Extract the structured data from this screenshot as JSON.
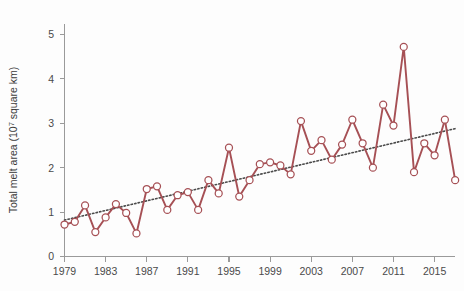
{
  "chart_data": {
    "type": "line",
    "title": "",
    "subtitle": "",
    "xlabel": "",
    "ylabel": "Total melt area (10⁷ square km)",
    "ylabel_parts": {
      "before": "Total melt area (10",
      "sup": "7",
      "after": " square km)"
    },
    "xlim": [
      1978.2,
      2017.6
    ],
    "ylim": [
      0,
      5.45
    ],
    "grid": false,
    "legend": null,
    "x_tick_labels": [
      "1979",
      "1983",
      "1987",
      "1991",
      "1995",
      "1999",
      "2003",
      "2007",
      "2011",
      "2015"
    ],
    "x_tick_values": [
      1979,
      1983,
      1987,
      1991,
      1995,
      1999,
      2003,
      2007,
      2011,
      2015
    ],
    "y_tick_labels": [
      "0",
      "1",
      "2",
      "3",
      "4",
      "5"
    ],
    "y_tick_values": [
      0,
      1,
      2,
      3,
      4,
      5
    ],
    "x": [
      1979,
      1980,
      1981,
      1982,
      1983,
      1984,
      1985,
      1986,
      1987,
      1988,
      1989,
      1990,
      1991,
      1992,
      1993,
      1994,
      1995,
      1996,
      1997,
      1998,
      1999,
      2000,
      2001,
      2002,
      2003,
      2004,
      2005,
      2006,
      2007,
      2008,
      2009,
      2010,
      2011,
      2012,
      2013,
      2014,
      2015,
      2016,
      2017
    ],
    "series": [
      {
        "name": "Total melt area",
        "color": "#a65055",
        "marker": "open-circle",
        "marker_face": "#ffffff",
        "values": [
          0.72,
          0.78,
          1.15,
          0.55,
          0.88,
          1.18,
          0.98,
          0.52,
          1.52,
          1.58,
          1.05,
          1.38,
          1.45,
          1.05,
          1.72,
          1.42,
          2.45,
          1.35,
          1.72,
          2.08,
          2.12,
          2.05,
          1.85,
          3.05,
          2.38,
          2.62,
          2.18,
          2.52,
          3.08,
          2.55,
          2.0,
          3.42,
          2.95,
          4.72,
          1.9,
          2.55,
          2.28,
          3.08,
          1.72
        ]
      }
    ],
    "trend": {
      "name": "Linear trend",
      "color": "#4a4a4a",
      "style": "dotted",
      "x": [
        1979,
        2017
      ],
      "values": [
        0.82,
        2.88
      ]
    }
  }
}
